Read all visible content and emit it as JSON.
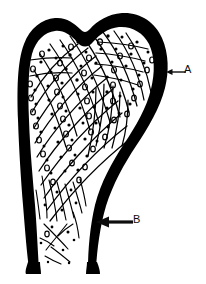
{
  "figure": {
    "background_color": "#ffffff",
    "ink_color": "#000000",
    "width": 206,
    "height": 284
  },
  "labels": [
    {
      "id": "A",
      "text": "A",
      "points_to": "cortical-bone-outer-shell",
      "arrow": {
        "style": "thin",
        "direction": "left",
        "tail_x": 186,
        "tail_y": 72,
        "head_x": 166,
        "head_y": 72
      },
      "text_x": 184,
      "text_y": 64
    },
    {
      "id": "B",
      "text": "B",
      "points_to": "compact-bone-shaft-wall",
      "arrow": {
        "style": "thick",
        "direction": "left",
        "tail_x": 133,
        "tail_y": 222,
        "head_x": 96,
        "head_y": 222
      },
      "text_x": 133,
      "text_y": 214
    }
  ],
  "structures": {
    "cortex": {
      "name": "cortical-bone-outline",
      "fill": "#000000",
      "description": "Thick black outline forming the expanded head/trochanter region above and the two tapering shaft walls below"
    },
    "marrow": {
      "name": "medullary-cavity",
      "fill": "#ffffff"
    },
    "trabeculae": {
      "name": "trabecular-lattice",
      "stroke": "#000000",
      "description": "Criss-crossing curved lines filling the upper spongy-bone region, thinning to sparse strands in the shaft"
    },
    "lacunae": {
      "name": "osteocyte-lacunae-dots",
      "fill": "#000000",
      "description": "Small solid dots and small open ovals scattered between the trabeculae"
    }
  }
}
